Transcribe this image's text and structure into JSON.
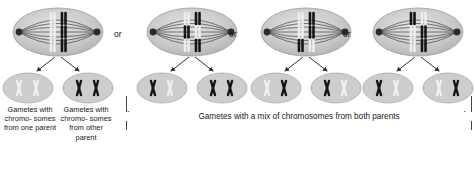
{
  "figure": {
    "type": "biology-diagram",
    "colors": {
      "maternal_chromosome": "#1a1a1a",
      "paternal_chromosome": "#d9d9d9",
      "cell_fill": "#c9c9c9",
      "spindle_fiber": "#333333",
      "arrow": "#333333",
      "text": "#202020",
      "background": "#ffffff"
    }
  },
  "separators": [
    {
      "label": "or"
    },
    {
      "label": "or"
    },
    {
      "label": "or"
    }
  ],
  "groups": [
    {
      "id": "group-1",
      "cell": {
        "chromosome_pairs": 3,
        "alignment": [
          {
            "left": "light",
            "right": "dark"
          },
          {
            "left": "light",
            "right": "dark"
          },
          {
            "left": "light",
            "right": "dark"
          }
        ]
      },
      "gametes": [
        {
          "id": "gamete-1a",
          "chromosomes": [
            "light",
            "light"
          ]
        },
        {
          "id": "gamete-1b",
          "chromosomes": [
            "dark",
            "dark"
          ]
        }
      ]
    },
    {
      "id": "group-2",
      "cell": {
        "chromosome_pairs": 3,
        "alignment": [
          {
            "left": "light",
            "right": "dark"
          },
          {
            "left": "dark",
            "right": "light"
          },
          {
            "left": "light",
            "right": "dark"
          }
        ]
      },
      "gametes": [
        {
          "id": "gamete-2a",
          "chromosomes": [
            "dark",
            "light"
          ]
        },
        {
          "id": "gamete-2b",
          "chromosomes": [
            "dark",
            "dark"
          ]
        }
      ]
    },
    {
      "id": "group-3",
      "cell": {
        "chromosome_pairs": 3,
        "alignment": [
          {
            "left": "light",
            "right": "dark"
          },
          {
            "left": "light",
            "right": "dark"
          },
          {
            "left": "dark",
            "right": "light"
          }
        ]
      },
      "gametes": [
        {
          "id": "gamete-3a",
          "chromosomes": [
            "light",
            "dark"
          ]
        },
        {
          "id": "gamete-3b",
          "chromosomes": [
            "dark",
            "light"
          ]
        }
      ]
    },
    {
      "id": "group-4",
      "cell": {
        "chromosome_pairs": 3,
        "alignment": [
          {
            "left": "dark",
            "right": "light"
          },
          {
            "left": "light",
            "right": "dark"
          },
          {
            "left": "light",
            "right": "dark"
          }
        ]
      },
      "gametes": [
        {
          "id": "gamete-4a",
          "chromosomes": [
            "dark",
            "light"
          ]
        },
        {
          "id": "gamete-4b",
          "chromosomes": [
            "light",
            "dark"
          ]
        }
      ]
    }
  ],
  "captions": {
    "left": "Gametes with chromo- somes from one parent",
    "right": "Gametes with chromo- somes from other parent",
    "bracket": "Gametes with a mix of chromosomes from both parents"
  }
}
